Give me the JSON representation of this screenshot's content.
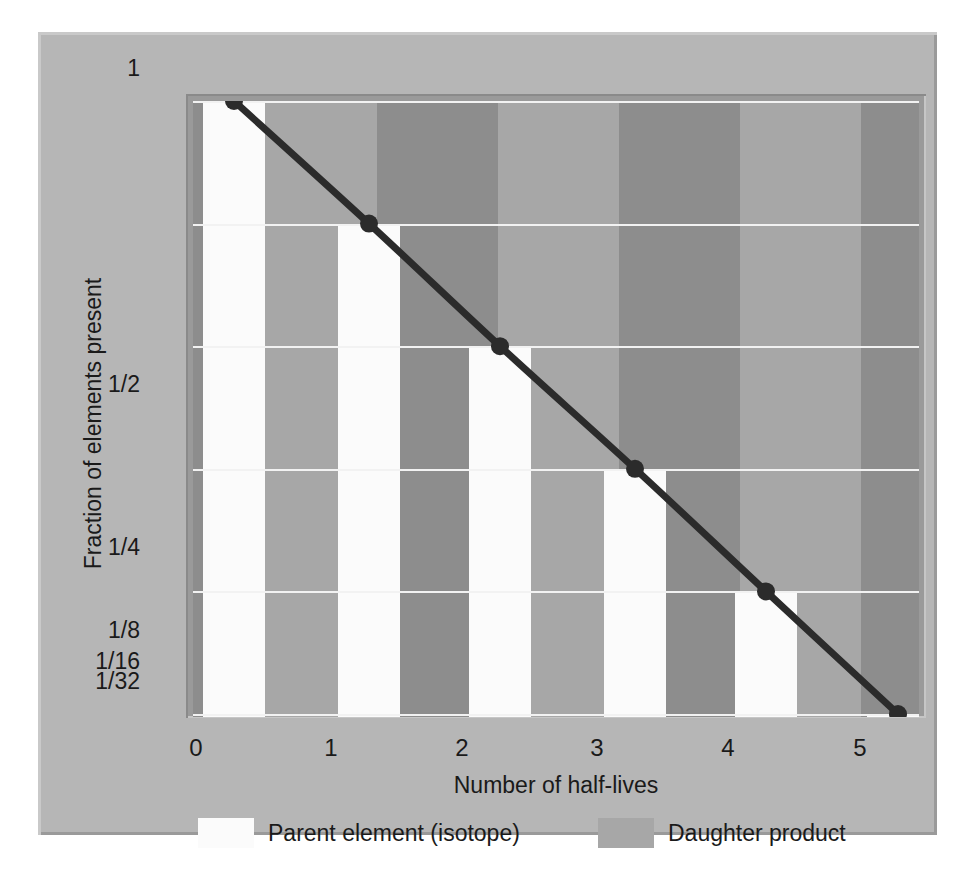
{
  "figure": {
    "top_caption_remnant": "",
    "colors": {
      "panel_background": "#b6b6b6",
      "plot_border": "#9a9a9a",
      "parent_column": "#fbfbfb",
      "daughter_dark": "#8d8d8d",
      "daughter_light": "#a7a7a7",
      "gridline": "#f2f2f2",
      "curve": "#2b2b2b",
      "text": "#1a1a1a"
    }
  },
  "chart_data": {
    "type": "line",
    "title": "",
    "xlabel": "Number of half-lives",
    "ylabel": "Fraction of elements present",
    "x": [
      0,
      1,
      2,
      3,
      4,
      5
    ],
    "xticklabels": [
      "0",
      "1",
      "2",
      "3",
      "4",
      "5"
    ],
    "values": [
      1,
      0.5,
      0.25,
      0.125,
      0.0625,
      0.03125
    ],
    "yticklabels": [
      "1",
      "1/2",
      "1/4",
      "1/8",
      "1/16",
      "1/32"
    ],
    "ytickvalues": [
      1,
      0.5,
      0.25,
      0.125,
      0.0625,
      0.03125
    ],
    "yscale": "log2",
    "ylim": [
      0.03125,
      1
    ],
    "xlim": [
      0,
      5
    ],
    "grid": true,
    "legend_position": "bottom",
    "series": [
      {
        "name": "Parent element (isotope)",
        "type": "bar",
        "color": "#fbfbfb",
        "values": [
          1,
          0.5,
          0.25,
          0.125,
          0.0625,
          0.03125
        ]
      },
      {
        "name": "Daughter product",
        "type": "bar",
        "color": "#8d8d8d",
        "values": [
          0,
          0.5,
          0.75,
          0.875,
          0.9375,
          0.96875
        ]
      },
      {
        "name": "decay-curve",
        "type": "line",
        "color": "#2b2b2b",
        "values": [
          1,
          0.5,
          0.25,
          0.125,
          0.0625,
          0.03125
        ]
      }
    ],
    "annotations": []
  },
  "axes": {
    "y_title": "Fraction of elements present",
    "x_title": "Number of half-lives",
    "yticks": [
      {
        "label": "1",
        "y_px": 69
      },
      {
        "label": "1/2",
        "y_px": 385
      },
      {
        "label": "1/4",
        "y_px": 548
      },
      {
        "label": "1/8",
        "y_px": 631
      },
      {
        "label": "1/16",
        "y_px": 662
      },
      {
        "label": "1/32",
        "y_px": 682
      }
    ],
    "xticks": [
      {
        "label": "0",
        "x_px": 196
      },
      {
        "label": "1",
        "x_px": 331
      },
      {
        "label": "2",
        "x_px": 462
      },
      {
        "label": "3",
        "x_px": 597
      },
      {
        "label": "4",
        "x_px": 728
      },
      {
        "label": "5",
        "x_px": 860
      }
    ]
  },
  "legend": {
    "items": [
      {
        "label": "Parent element (isotope)",
        "color": "#fbfbfb",
        "x_px": 50
      },
      {
        "label": "Daughter product",
        "color": "#a7a7a7",
        "x_px": 450
      }
    ]
  }
}
